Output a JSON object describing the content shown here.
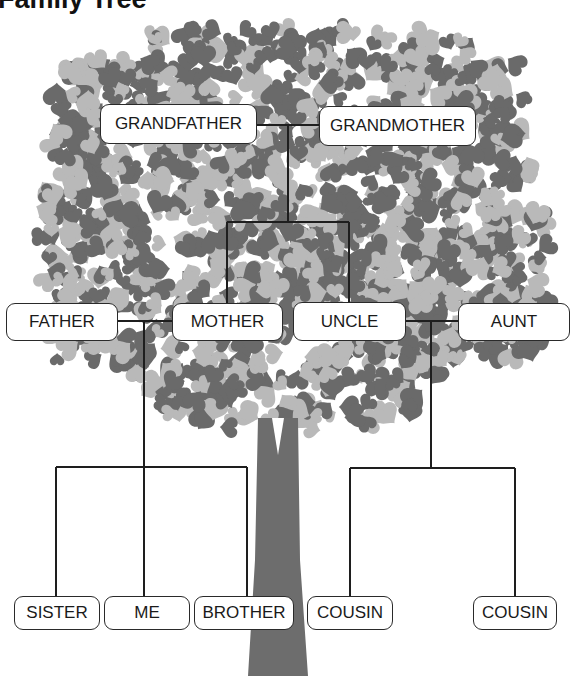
{
  "title": "Family Tree",
  "colors": {
    "leaf_dark": "#6a6a6a",
    "leaf_light": "#b9b9b9",
    "trunk": "#6d6d6d",
    "line": "#1e1e1e",
    "node_border": "#2a2a2a",
    "node_fill": "#ffffff"
  },
  "nodes": {
    "grandfather": {
      "label": "GRANDFATHER",
      "x": 100,
      "y": 104,
      "w": 157,
      "h": 40
    },
    "grandmother": {
      "label": "GRANDMOTHER",
      "x": 319,
      "y": 106,
      "w": 157,
      "h": 40
    },
    "father": {
      "label": "FATHER",
      "x": 6,
      "y": 303,
      "w": 112,
      "h": 38
    },
    "mother": {
      "label": "MOTHER",
      "x": 172,
      "y": 303,
      "w": 111,
      "h": 38
    },
    "uncle": {
      "label": "UNCLE",
      "x": 293,
      "y": 302,
      "w": 113,
      "h": 39
    },
    "aunt": {
      "label": "AUNT",
      "x": 458,
      "y": 303,
      "w": 112,
      "h": 38
    },
    "sister": {
      "label": "SISTER",
      "x": 14,
      "y": 596,
      "w": 86,
      "h": 34
    },
    "me": {
      "label": "ME",
      "x": 104,
      "y": 596,
      "w": 86,
      "h": 34
    },
    "brother": {
      "label": "BROTHER",
      "x": 194,
      "y": 596,
      "w": 100,
      "h": 34
    },
    "cousin1": {
      "label": "COUSIN",
      "x": 307,
      "y": 596,
      "w": 86,
      "h": 34
    },
    "cousin2": {
      "label": "COUSIN",
      "x": 473,
      "y": 596,
      "w": 84,
      "h": 34
    }
  },
  "connectors": [
    {
      "name": "grandparents-couple-line",
      "points": [
        [
          257,
          125
        ],
        [
          319,
          125
        ]
      ]
    },
    {
      "name": "grandparents-stem",
      "points": [
        [
          288,
          125
        ],
        [
          288,
          222
        ]
      ]
    },
    {
      "name": "grandparents-children-bar",
      "points": [
        [
          227,
          222
        ],
        [
          349,
          222
        ]
      ]
    },
    {
      "name": "to-mother",
      "points": [
        [
          227,
          222
        ],
        [
          227,
          303
        ]
      ]
    },
    {
      "name": "to-uncle",
      "points": [
        [
          349,
          222
        ],
        [
          349,
          302
        ]
      ]
    },
    {
      "name": "parents-couple-line",
      "points": [
        [
          118,
          321
        ],
        [
          172,
          321
        ]
      ]
    },
    {
      "name": "parents-stem",
      "points": [
        [
          144,
          321
        ],
        [
          144,
          596
        ]
      ]
    },
    {
      "name": "siblings-bar",
      "points": [
        [
          56,
          467
        ],
        [
          247,
          467
        ]
      ]
    },
    {
      "name": "to-sister",
      "points": [
        [
          56,
          467
        ],
        [
          56,
          596
        ]
      ]
    },
    {
      "name": "to-brother",
      "points": [
        [
          247,
          467
        ],
        [
          247,
          596
        ]
      ]
    },
    {
      "name": "uncle-aunt-couple-line",
      "points": [
        [
          406,
          321
        ],
        [
          458,
          321
        ]
      ]
    },
    {
      "name": "uncle-aunt-stem",
      "points": [
        [
          431,
          321
        ],
        [
          431,
          468
        ]
      ]
    },
    {
      "name": "cousins-bar",
      "points": [
        [
          350,
          468
        ],
        [
          515,
          468
        ]
      ]
    },
    {
      "name": "to-cousin1",
      "points": [
        [
          350,
          468
        ],
        [
          350,
          596
        ]
      ]
    },
    {
      "name": "to-cousin2",
      "points": [
        [
          515,
          468
        ],
        [
          515,
          596
        ]
      ]
    }
  ],
  "trunk": {
    "points": [
      [
        258,
        418
      ],
      [
        298,
        418
      ],
      [
        300,
        560
      ],
      [
        308,
        676
      ],
      [
        248,
        676
      ],
      [
        255,
        560
      ]
    ],
    "notch": [
      [
        272,
        418
      ],
      [
        284,
        418
      ],
      [
        278,
        455
      ]
    ]
  },
  "crown": {
    "x0": 40,
    "x1": 545,
    "y0": 30,
    "y1": 430,
    "seed": 7,
    "count": 1400
  }
}
